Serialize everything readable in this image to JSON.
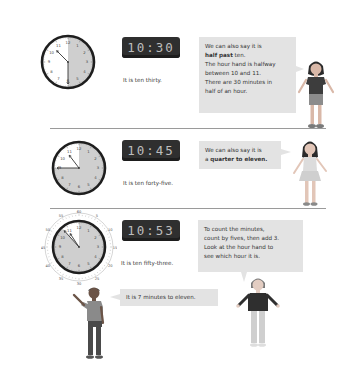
{
  "sections": [
    {
      "analog": {
        "hour": 10,
        "minute": 30,
        "shaded_minutes": 30
      },
      "digital": "10:30",
      "caption": "It is ten thirty.",
      "bubble": {
        "lines": [
          {
            "text": "We can also say it is"
          },
          {
            "bold": "half past",
            "text": " ten."
          },
          {
            "text": "The hour hand is halfway"
          },
          {
            "text": "between 10 and 11."
          },
          {
            "text": "There are 30 minutes in"
          },
          {
            "text": "half of an hour."
          }
        ]
      },
      "character": "girl-with-pigtails"
    },
    {
      "analog": {
        "hour": 10,
        "minute": 45,
        "shaded_minutes": 45
      },
      "digital": "10:45",
      "caption": "It is ten forty-five.",
      "bubble": {
        "lines": [
          {
            "text": "We can also say it is"
          },
          {
            "text": "a ",
            "bold": "quarter to eleven."
          }
        ]
      },
      "character": "girl-in-skirt"
    },
    {
      "analog": {
        "hour": 10,
        "minute": 53,
        "shaded_minutes": 53,
        "outer_ring_labels": [
          "60",
          "5",
          "10",
          "15",
          "20",
          "25",
          "30",
          "35",
          "40",
          "45",
          "50",
          "55"
        ]
      },
      "digital": "10:53",
      "caption": "It is ten fifty-three.",
      "bubble": {
        "lines": [
          {
            "text": "To count the minutes,"
          },
          {
            "text": "count by fives, then add 3."
          },
          {
            "text": "Look at the hour hand to"
          },
          {
            "text": "see which hour it is."
          }
        ]
      },
      "boy_bubble": "It is 7 minutes to eleven.",
      "characters": [
        "boy-waving",
        "child-shrugging"
      ]
    }
  ],
  "clock_numbers": [
    "12",
    "1",
    "2",
    "3",
    "4",
    "5",
    "6",
    "7",
    "8",
    "9",
    "10",
    "11"
  ],
  "colors": {
    "bubble_bg": "#e3e3e3",
    "clock_shade": "#cfcfcf",
    "digital_bg": "#2f2f2f",
    "digital_text": "#bdbdbd",
    "divider": "#9a9a9a"
  }
}
